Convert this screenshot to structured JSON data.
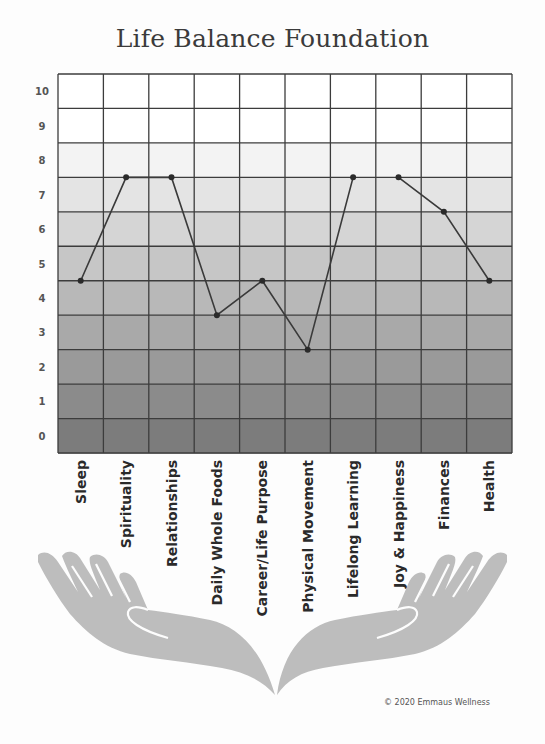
{
  "header": {
    "title": "Life Balance Foundation"
  },
  "footer": {
    "copyright": "© 2020 Emmaus Wellness"
  },
  "colors": {
    "band_top": "#ffffff",
    "band_bottom": "#7c7c7c",
    "grid": "#3c3c3c",
    "line": "#3a3a3a",
    "hands": "#bdbdbd"
  },
  "chart_data": {
    "type": "line",
    "title": "Life Balance Foundation",
    "xlabel": "",
    "ylabel": "",
    "categories": [
      "Sleep",
      "Spirituality",
      "Relationships",
      "Daily Whole Foods",
      "Career/Life Purpose",
      "Physical Movement",
      "Lifelong Learning",
      "Joy & Happiness",
      "Finances",
      "Health"
    ],
    "values": [
      4.5,
      7.5,
      7.5,
      3.5,
      4.5,
      2.5,
      7.5,
      7.5,
      6.5,
      4.5
    ],
    "segments": [
      [
        0,
        6
      ],
      [
        7,
        9
      ]
    ],
    "y_ticks": [
      "0",
      "1",
      "2",
      "3",
      "4",
      "5",
      "6",
      "7",
      "8",
      "9",
      "10"
    ],
    "ylim": [
      -0.5,
      10.5
    ],
    "grid": true,
    "legend": null,
    "background": "grayscale gradient bands, white at 10 to dark grey at 0",
    "decoration": "two open cupped hands beneath the chart"
  }
}
